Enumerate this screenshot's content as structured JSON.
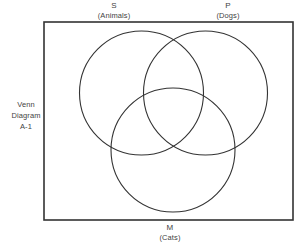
{
  "diagram": {
    "type": "venn-3-circle",
    "caption_lines": [
      "Venn",
      "Diagram",
      "A-1"
    ],
    "background_color": "#ffffff",
    "stroke_color": "#333333",
    "text_color": "#3f3f3f",
    "frame": {
      "x": 44,
      "y": 22,
      "width": 249,
      "height": 198
    },
    "sets": [
      {
        "id": "S",
        "symbol": "S",
        "name": "(Animals)",
        "label_position": "top-left",
        "center_x": 141.5,
        "center_y": 93,
        "radius": 62
      },
      {
        "id": "P",
        "symbol": "P",
        "name": "(Dogs)",
        "label_position": "top-right",
        "center_x": 205.5,
        "center_y": 93,
        "radius": 62
      },
      {
        "id": "M",
        "symbol": "M",
        "name": "(Cats)",
        "label_position": "bottom-center",
        "center_x": 173,
        "center_y": 150,
        "radius": 62
      }
    ]
  }
}
